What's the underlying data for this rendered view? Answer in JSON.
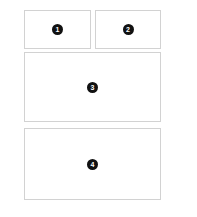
{
  "canvas": {
    "width": 197,
    "height": 217,
    "background_color": "#ffffff"
  },
  "style": {
    "panel_fill": "#ffffff",
    "panel_border_color": "#d2d2d2",
    "badge_fill": "#111111",
    "badge_text_color": "#ffffff"
  },
  "layout": {
    "name": "wireframe-layout",
    "rows": [
      {
        "row_index": 1,
        "columns": 2
      },
      {
        "row_index": 2,
        "columns": 1
      },
      {
        "row_index": 3,
        "columns": 1
      }
    ]
  },
  "panels": [
    {
      "id": "panel-1",
      "badge_label": "1",
      "row": 1,
      "column": 1
    },
    {
      "id": "panel-2",
      "badge_label": "2",
      "row": 1,
      "column": 2
    },
    {
      "id": "panel-3",
      "badge_label": "3",
      "row": 2,
      "column": 1
    },
    {
      "id": "panel-4",
      "badge_label": "4",
      "row": 3,
      "column": 1
    }
  ]
}
